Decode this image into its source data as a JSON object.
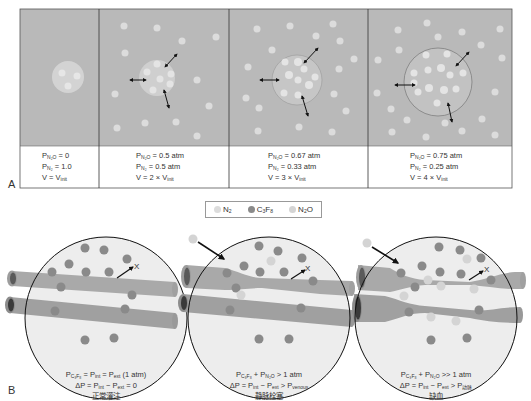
{
  "figure": {
    "panel_a_label": "A",
    "panel_b_label": "B",
    "colors": {
      "tissue_gray": "#b9b9b9",
      "bubble_fill": "#d0d0d0",
      "n2_dot": "#dcdcdc",
      "c3f8_dot": "#8a8a8a",
      "vessel": "#a8a8a8",
      "vessel_dark": "#555555",
      "circle_bg": "#ececec"
    }
  },
  "panel_a": {
    "cells": [
      {
        "line1_prefix": "P",
        "line1_sub": "N₂O",
        "line1_rest": " = 0",
        "line2_prefix": "P",
        "line2_sub": "N₂",
        "line2_rest": " = 1.0",
        "line3_prefix": "V = V",
        "line3_sub": "init",
        "line3_rest": ""
      },
      {
        "line1_prefix": "P",
        "line1_sub": "N₂O",
        "line1_rest": " = 0.5 atm",
        "line2_prefix": "P",
        "line2_sub": "N₂",
        "line2_rest": " = 0.5 atm",
        "line3_prefix": "V = 2 × V",
        "line3_sub": "init",
        "line3_rest": ""
      },
      {
        "line1_prefix": "P",
        "line1_sub": "N₂O",
        "line1_rest": " = 0.67 atm",
        "line2_prefix": "P",
        "line2_sub": "N₂",
        "line2_rest": " = 0.33 atm",
        "line3_prefix": "V = 3 × V",
        "line3_sub": "init",
        "line3_rest": ""
      },
      {
        "line1_prefix": "P",
        "line1_sub": "N₂O",
        "line1_rest": " = 0.75 atm",
        "line2_prefix": "P",
        "line2_sub": "N₂",
        "line2_rest": " = 0.25 atm",
        "line3_prefix": "V = 4 × V",
        "line3_sub": "init",
        "line3_rest": ""
      }
    ]
  },
  "legend": {
    "items": [
      {
        "label": "N",
        "sub": "2",
        "label2": "",
        "sub2": "",
        "tail": "",
        "color": "#dcdcdc"
      },
      {
        "label": "C",
        "sub": "3",
        "label2": "F",
        "sub2": "8",
        "tail": "",
        "color": "#8a8a8a"
      },
      {
        "label": "N",
        "sub": "2",
        "label2": "O",
        "sub2": "",
        "tail": "",
        "color": "#d4d4d4"
      }
    ]
  },
  "panel_b": {
    "x_marker": "X",
    "cases": [
      {
        "eq1_a": "P",
        "eq1_a_sub": "C₃F₈",
        "eq1_b": " = P",
        "eq1_b_sub": "int",
        "eq1_c": " = P",
        "eq1_c_sub": "ext",
        "eq1_d": " (1 atm)",
        "eq2_a": "ΔP = P",
        "eq2_a_sub": "int",
        "eq2_b": " − P",
        "eq2_b_sub": "ext",
        "eq2_c": " = 0",
        "eq2_c_sub": "",
        "label_zh": "正常灌注"
      },
      {
        "eq1_a": "P",
        "eq1_a_sub": "C₃F₈",
        "eq1_b": " + P",
        "eq1_b_sub": "N₂O",
        "eq1_c": " > 1 atm",
        "eq1_c_sub": "",
        "eq1_d": "",
        "eq2_a": "ΔP = P",
        "eq2_a_sub": "int",
        "eq2_b": " − P",
        "eq2_b_sub": "ext",
        "eq2_c": " > P",
        "eq2_c_sub": "venous",
        "label_zh": "静脉栓塞"
      },
      {
        "eq1_a": "P",
        "eq1_a_sub": "C₃F₈",
        "eq1_b": " + P",
        "eq1_b_sub": "N₂O",
        "eq1_c": " >> 1 atm",
        "eq1_c_sub": "",
        "eq1_d": "",
        "eq2_a": "ΔP = P",
        "eq2_a_sub": "int",
        "eq2_b": " − P",
        "eq2_b_sub": "ext",
        "eq2_c": " > P",
        "eq2_c_sub": "动脉",
        "label_zh": "缺血"
      }
    ]
  }
}
